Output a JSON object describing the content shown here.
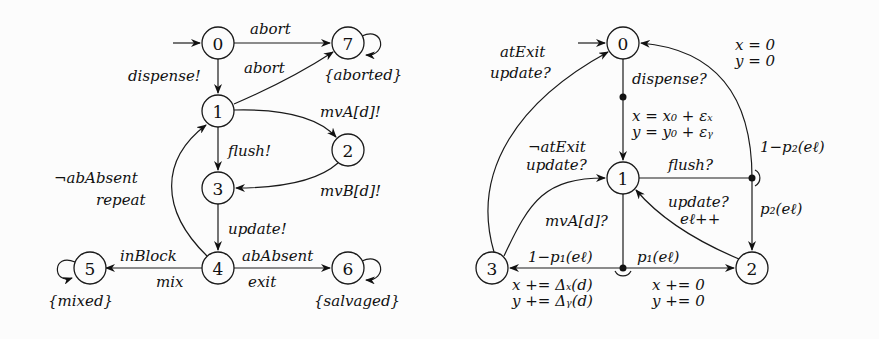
{
  "left_diagram": {
    "nodes": [
      "0",
      "1",
      "2",
      "3",
      "4",
      "5",
      "6",
      "7"
    ],
    "edges": {
      "e0_7": "abort",
      "e0_1": "dispense!",
      "e1_7": "abort",
      "e1_2": "mvA[d]!",
      "e1_3": "flush!",
      "e2_3": "mvB[d]!",
      "e3_4": "update!",
      "e4_1_a": "¬abAbsent",
      "e4_1_b": "repeat",
      "e4_5_a": "inBlock",
      "e4_5_b": "mix",
      "e4_6_a": "abAbsent",
      "e4_6_b": "exit"
    },
    "state_labels": {
      "s7": "{aborted}",
      "s5": "{mixed}",
      "s6": "{salvaged}"
    }
  },
  "right_diagram": {
    "nodes": [
      "0",
      "1",
      "2",
      "3"
    ],
    "edges": {
      "e0_1_action": "dispense?",
      "e0_1_upd_x": "x = x₀ + εₓ",
      "e0_1_upd_y": "y = y₀ + εᵧ",
      "e3_0_a": "atExit",
      "e3_0_b": "update?",
      "e3_1_a": "¬atExit",
      "e3_1_b": "update?",
      "e1_flush": "flush?",
      "p2_back": "1−p₂(eℓ)",
      "p2_fwd": "p₂(eℓ)",
      "reset_x": "x = 0",
      "reset_y": "y = 0",
      "e2_1_a": "update?",
      "e2_1_b": "eℓ++",
      "e1_mv": "mvA[d]?",
      "p1_back": "1−p₁(eℓ)",
      "p1_fwd": "p₁(eℓ)",
      "upd3_x": "x += Δₓ(d)",
      "upd3_y": "y += Δᵧ(d)",
      "upd2_x": "x += 0",
      "upd2_y": "y += 0"
    }
  }
}
